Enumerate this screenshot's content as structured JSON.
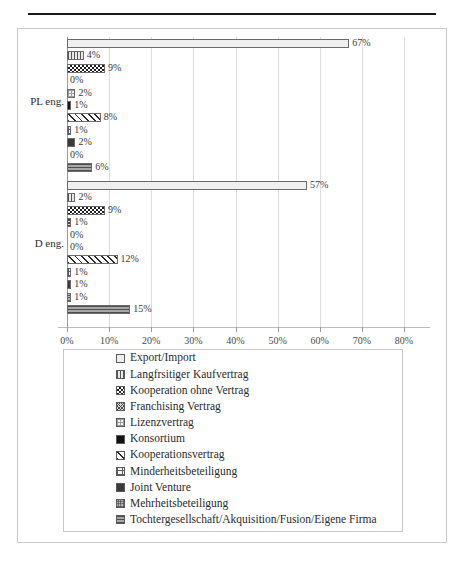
{
  "top_note": "",
  "chart_data": {
    "type": "bar",
    "orientation": "horizontal",
    "title": "",
    "xlabel": "",
    "ylabel": "",
    "xlim": [
      0,
      80
    ],
    "xticks": [
      "0%",
      "10%",
      "20%",
      "30%",
      "40%",
      "50%",
      "60%",
      "70%",
      "80%"
    ],
    "xtick_values": [
      0,
      10,
      20,
      30,
      40,
      50,
      60,
      70,
      80
    ],
    "grid": true,
    "legend_position": "bottom",
    "categories": [
      "PL eng.",
      "D eng."
    ],
    "series": [
      {
        "name": "Export/Import",
        "values": [
          67,
          57
        ],
        "labels": [
          "67%",
          "57%"
        ],
        "pattern": "p0"
      },
      {
        "name": "Langfrsitiger Kaufvertrag",
        "values": [
          4,
          2
        ],
        "labels": [
          "4%",
          "2%"
        ],
        "pattern": "p1"
      },
      {
        "name": "Kooperation ohne Vertrag",
        "values": [
          9,
          9
        ],
        "labels": [
          "9%",
          "9%"
        ],
        "pattern": "p2"
      },
      {
        "name": "Franchising Vertrag",
        "values": [
          0,
          1
        ],
        "labels": [
          "0%",
          "1%"
        ],
        "pattern": "p3"
      },
      {
        "name": "Lizenzvertrag",
        "values": [
          2,
          0
        ],
        "labels": [
          "2%",
          "0%"
        ],
        "pattern": "p4"
      },
      {
        "name": "Konsortium",
        "values": [
          1,
          0
        ],
        "labels": [
          "1%",
          "0%"
        ],
        "pattern": "p5"
      },
      {
        "name": "Kooperationsvertrag",
        "values": [
          8,
          12
        ],
        "labels": [
          "8%",
          "12%"
        ],
        "pattern": "p6"
      },
      {
        "name": "Minderheitsbeteiligung",
        "values": [
          1,
          1
        ],
        "labels": [
          "1%",
          "1%"
        ],
        "pattern": "p7"
      },
      {
        "name": "Joint Venture",
        "values": [
          2,
          1
        ],
        "labels": [
          "2%",
          "1%"
        ],
        "pattern": "p8"
      },
      {
        "name": "Mehrheitsbeteiligung",
        "values": [
          0,
          1
        ],
        "labels": [
          "0%",
          "1%"
        ],
        "pattern": "p9"
      },
      {
        "name": "Tochtergesellschaft/Akquisition/Fusion/Eigene Firma",
        "values": [
          6,
          15
        ],
        "labels": [
          "6%",
          "15%"
        ],
        "pattern": "p10"
      }
    ]
  }
}
